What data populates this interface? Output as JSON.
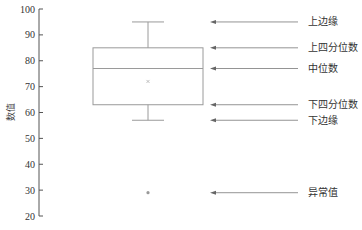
{
  "chart_data": {
    "type": "box",
    "title": "",
    "xlabel": "",
    "ylabel": "数值",
    "ylim": [
      20,
      100
    ],
    "yticks": [
      20,
      30,
      40,
      50,
      60,
      70,
      80,
      90,
      100
    ],
    "grid": false,
    "box": {
      "upper_whisker": 95,
      "q3": 85,
      "median": 77,
      "mean": 72,
      "q1": 63,
      "lower_whisker": 57,
      "outliers": [
        29
      ]
    },
    "annotations": [
      {
        "label": "上边缘",
        "target": "upper_whisker",
        "value": 95
      },
      {
        "label": "上四分位数",
        "target": "q3",
        "value": 85
      },
      {
        "label": "中位数",
        "target": "median",
        "value": 77
      },
      {
        "label": "下四分位数",
        "target": "q1",
        "value": 63
      },
      {
        "label": "下边缘",
        "target": "lower_whisker",
        "value": 57
      },
      {
        "label": "异常值",
        "target": "outlier",
        "value": 29
      }
    ]
  },
  "colors": {
    "box_stroke": "#9a9a9a",
    "axis": "#555555",
    "arrow": "#888888",
    "mean_marker": "#b0b0b0",
    "outlier": "#999999"
  }
}
